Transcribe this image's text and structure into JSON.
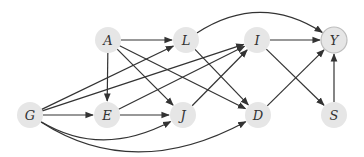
{
  "diagram": {
    "type": "directed-acyclic-graph",
    "colors": {
      "node_fill": "#e6e6e6",
      "outcome_stroke": "#bdbdbd",
      "edge": "#333333",
      "background": "#ffffff"
    },
    "nodes": [
      {
        "id": "A",
        "label": "A",
        "x": 108,
        "y": 40
      },
      {
        "id": "L",
        "label": "L",
        "x": 186,
        "y": 40
      },
      {
        "id": "I",
        "label": "I",
        "x": 257,
        "y": 40
      },
      {
        "id": "Y",
        "label": "Y",
        "x": 334,
        "y": 40,
        "outcome": true
      },
      {
        "id": "G",
        "label": "G",
        "x": 30,
        "y": 115
      },
      {
        "id": "E",
        "label": "E",
        "x": 107,
        "y": 115
      },
      {
        "id": "J",
        "label": "J",
        "x": 183,
        "y": 115
      },
      {
        "id": "D",
        "label": "D",
        "x": 258,
        "y": 115
      },
      {
        "id": "S",
        "label": "S",
        "x": 334,
        "y": 115
      }
    ],
    "edges": [
      {
        "from": "A",
        "to": "L"
      },
      {
        "from": "A",
        "to": "E"
      },
      {
        "from": "A",
        "to": "J"
      },
      {
        "from": "A",
        "to": "D"
      },
      {
        "from": "L",
        "to": "Y",
        "curved": true
      },
      {
        "from": "L",
        "to": "D"
      },
      {
        "from": "I",
        "to": "Y"
      },
      {
        "from": "I",
        "to": "S"
      },
      {
        "from": "G",
        "to": "L"
      },
      {
        "from": "G",
        "to": "I"
      },
      {
        "from": "G",
        "to": "E"
      },
      {
        "from": "G",
        "to": "J",
        "curved": true
      },
      {
        "from": "G",
        "to": "D",
        "curved": true
      },
      {
        "from": "E",
        "to": "J"
      },
      {
        "from": "E",
        "to": "I"
      },
      {
        "from": "J",
        "to": "I"
      },
      {
        "from": "D",
        "to": "Y"
      },
      {
        "from": "S",
        "to": "Y"
      }
    ]
  }
}
